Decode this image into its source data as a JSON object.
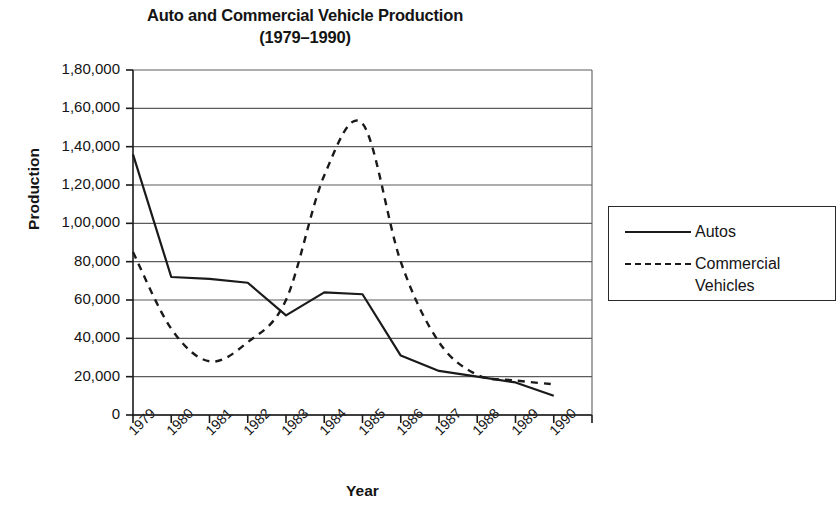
{
  "chart_data": {
    "type": "line",
    "title": "Auto and Commercial Vehicle Production",
    "subtitle": "(1979–1990)",
    "xlabel": "Year",
    "ylabel": "Production",
    "categories": [
      "1979",
      "1980",
      "1981",
      "1982",
      "1983",
      "1984",
      "1985",
      "1986",
      "1987",
      "1988",
      "1989",
      "1990"
    ],
    "x": [
      1979,
      1980,
      1981,
      1982,
      1983,
      1984,
      1985,
      1986,
      1987,
      1988,
      1989,
      1990
    ],
    "ylim": [
      0,
      180000
    ],
    "ytick_values": [
      0,
      20000,
      40000,
      60000,
      80000,
      100000,
      120000,
      140000,
      160000,
      180000
    ],
    "ytick_labels": [
      "0",
      "20,000",
      "40,000",
      "60,000",
      "80,000",
      "1,00,000",
      "1,20,000",
      "1,40,000",
      "1,60,000",
      "1,80,000"
    ],
    "grid": true,
    "grid_axis": "y",
    "legend_position": "right",
    "series": [
      {
        "name": "Autos",
        "style": "solid",
        "color": "#1a1a1a",
        "values": [
          136000,
          72000,
          71000,
          69000,
          52000,
          64000,
          63000,
          31000,
          23000,
          20000,
          17000,
          10000
        ]
      },
      {
        "name": "Commercial Vehicles",
        "style": "dashed",
        "color": "#1a1a1a",
        "values": [
          85000,
          45000,
          28000,
          38000,
          60000,
          125000,
          152000,
          80000,
          38000,
          21000,
          18000,
          16000
        ]
      }
    ]
  },
  "legend": {
    "items": [
      {
        "label": "Autos",
        "style": "solid"
      },
      {
        "label": "Commercial Vehicles",
        "style": "dashed"
      }
    ]
  }
}
